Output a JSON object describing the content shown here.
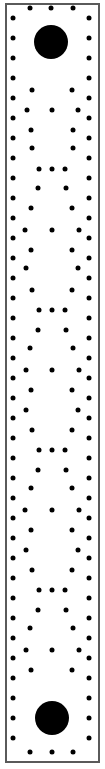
{
  "scene": {
    "title": "Pac-Man maze corridor",
    "type": "maze-strip",
    "width": 105,
    "height": 769,
    "background_color": "#ffffff",
    "border_color": "#5a5a5a",
    "pellet_color": "#000000"
  },
  "frame": {
    "x": 5,
    "y": 3,
    "width": 95,
    "height": 760,
    "border_width": 2
  },
  "chart_data": {
    "type": "scatter",
    "xlabel": "x (px)",
    "ylabel": "y (px)",
    "xlim": [
      0,
      105
    ],
    "ylim": [
      0,
      769
    ],
    "grid": false,
    "legend": [
      "pellet",
      "power-pellet"
    ],
    "series": [
      {
        "name": "power-pellet",
        "radius": 17,
        "points": [
          [
            51,
            42
          ],
          [
            52,
            718
          ]
        ]
      },
      {
        "name": "pellet",
        "radius": 2.5,
        "points": [
          [
            30,
            8
          ],
          [
            51,
            8
          ],
          [
            73,
            8
          ],
          [
            13,
            18
          ],
          [
            89,
            18
          ],
          [
            13,
            38
          ],
          [
            89,
            38
          ],
          [
            13,
            58
          ],
          [
            89,
            58
          ],
          [
            13,
            78
          ],
          [
            89,
            78
          ],
          [
            32,
            90
          ],
          [
            72,
            90
          ],
          [
            13,
            98
          ],
          [
            89,
            98
          ],
          [
            27,
            110
          ],
          [
            52,
            110
          ],
          [
            78,
            110
          ],
          [
            13,
            118
          ],
          [
            89,
            118
          ],
          [
            31,
            130
          ],
          [
            73,
            130
          ],
          [
            13,
            138
          ],
          [
            89,
            138
          ],
          [
            32,
            148
          ],
          [
            73,
            148
          ],
          [
            13,
            158
          ],
          [
            89,
            158
          ],
          [
            39,
            169
          ],
          [
            52,
            169
          ],
          [
            65,
            169
          ],
          [
            13,
            178
          ],
          [
            89,
            178
          ],
          [
            38,
            188
          ],
          [
            66,
            188
          ],
          [
            13,
            198
          ],
          [
            89,
            198
          ],
          [
            31,
            208
          ],
          [
            72,
            208
          ],
          [
            13,
            218
          ],
          [
            89,
            218
          ],
          [
            25,
            230
          ],
          [
            52,
            230
          ],
          [
            79,
            230
          ],
          [
            13,
            238
          ],
          [
            89,
            238
          ],
          [
            31,
            250
          ],
          [
            72,
            250
          ],
          [
            13,
            258
          ],
          [
            89,
            258
          ],
          [
            26,
            268
          ],
          [
            78,
            268
          ],
          [
            13,
            278
          ],
          [
            89,
            278
          ],
          [
            32,
            290
          ],
          [
            72,
            290
          ],
          [
            13,
            298
          ],
          [
            89,
            298
          ],
          [
            39,
            310
          ],
          [
            52,
            310
          ],
          [
            65,
            310
          ],
          [
            13,
            318
          ],
          [
            89,
            318
          ],
          [
            38,
            330
          ],
          [
            66,
            330
          ],
          [
            13,
            338
          ],
          [
            89,
            338
          ],
          [
            30,
            348
          ],
          [
            73,
            348
          ],
          [
            13,
            358
          ],
          [
            89,
            358
          ],
          [
            26,
            370
          ],
          [
            52,
            370
          ],
          [
            79,
            370
          ],
          [
            13,
            378
          ],
          [
            89,
            378
          ],
          [
            31,
            390
          ],
          [
            72,
            390
          ],
          [
            13,
            398
          ],
          [
            89,
            398
          ],
          [
            26,
            410
          ],
          [
            78,
            410
          ],
          [
            13,
            418
          ],
          [
            89,
            418
          ],
          [
            32,
            430
          ],
          [
            72,
            430
          ],
          [
            13,
            438
          ],
          [
            89,
            438
          ],
          [
            39,
            450
          ],
          [
            52,
            450
          ],
          [
            65,
            450
          ],
          [
            13,
            458
          ],
          [
            89,
            458
          ],
          [
            38,
            470
          ],
          [
            66,
            470
          ],
          [
            13,
            478
          ],
          [
            89,
            478
          ],
          [
            31,
            488
          ],
          [
            72,
            488
          ],
          [
            13,
            498
          ],
          [
            89,
            498
          ],
          [
            25,
            510
          ],
          [
            52,
            510
          ],
          [
            79,
            510
          ],
          [
            13,
            518
          ],
          [
            89,
            518
          ],
          [
            31,
            530
          ],
          [
            72,
            530
          ],
          [
            13,
            538
          ],
          [
            89,
            538
          ],
          [
            26,
            550
          ],
          [
            78,
            550
          ],
          [
            13,
            558
          ],
          [
            89,
            558
          ],
          [
            32,
            570
          ],
          [
            72,
            570
          ],
          [
            13,
            578
          ],
          [
            89,
            578
          ],
          [
            39,
            590
          ],
          [
            52,
            590
          ],
          [
            65,
            590
          ],
          [
            13,
            598
          ],
          [
            89,
            598
          ],
          [
            38,
            610
          ],
          [
            66,
            610
          ],
          [
            13,
            618
          ],
          [
            89,
            618
          ],
          [
            30,
            628
          ],
          [
            73,
            628
          ],
          [
            13,
            638
          ],
          [
            89,
            638
          ],
          [
            26,
            650
          ],
          [
            52,
            650
          ],
          [
            79,
            650
          ],
          [
            13,
            658
          ],
          [
            89,
            658
          ],
          [
            31,
            670
          ],
          [
            72,
            670
          ],
          [
            13,
            678
          ],
          [
            89,
            678
          ],
          [
            13,
            698
          ],
          [
            89,
            698
          ],
          [
            13,
            718
          ],
          [
            89,
            718
          ],
          [
            13,
            738
          ],
          [
            89,
            738
          ],
          [
            30,
            752
          ],
          [
            52,
            752
          ],
          [
            73,
            752
          ]
        ]
      }
    ]
  }
}
